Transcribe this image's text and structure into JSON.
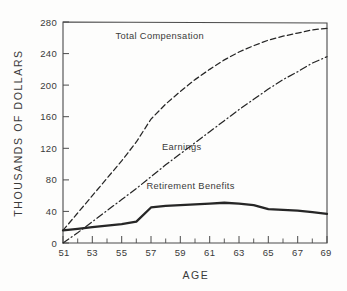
{
  "chart_data": {
    "type": "line",
    "title": "",
    "xlabel": "AGE",
    "ylabel": "THOUSANDS OF DOLLARS",
    "xlim": [
      51,
      69
    ],
    "ylim": [
      0,
      280
    ],
    "grid": false,
    "legend_position": "inline-annotations",
    "x": [
      51,
      52,
      53,
      54,
      55,
      56,
      57,
      58,
      59,
      60,
      61,
      62,
      63,
      64,
      65,
      66,
      67,
      68,
      69
    ],
    "xticks": [
      51,
      53,
      55,
      57,
      59,
      61,
      63,
      65,
      67,
      69
    ],
    "xtick_labels": [
      "51",
      "53",
      "55",
      "57",
      "59",
      "61",
      "63",
      "65",
      "67",
      "69"
    ],
    "xminor_ticks": [
      52,
      54,
      56,
      58,
      60,
      62,
      64,
      66,
      68
    ],
    "yticks": [
      0,
      40,
      80,
      120,
      160,
      200,
      240,
      280
    ],
    "ytick_labels": [
      "0",
      "40",
      "80",
      "120",
      "160",
      "200",
      "240",
      "280"
    ],
    "series": [
      {
        "name": "Total Compensation",
        "style": "dashed",
        "color": "#262626",
        "values": [
          16,
          38,
          60,
          82,
          104,
          128,
          157,
          176,
          192,
          207,
          220,
          232,
          242,
          250,
          257,
          262,
          266,
          270,
          272
        ]
      },
      {
        "name": "Earnings",
        "style": "dash-dot",
        "color": "#262626",
        "values": [
          0,
          13,
          27,
          41,
          55,
          69,
          84,
          99,
          113,
          127,
          141,
          155,
          169,
          182,
          195,
          207,
          217,
          228,
          236
        ]
      },
      {
        "name": "Retirement Benefits",
        "style": "solid",
        "color": "#262626",
        "values": [
          16,
          18,
          20,
          22,
          24,
          27,
          45,
          47,
          48,
          49,
          50,
          51,
          50,
          48,
          43,
          42,
          41,
          39,
          37
        ]
      }
    ],
    "annotations": [
      {
        "text": "Total Compensation",
        "x": 57.6,
        "y": 258
      },
      {
        "text": "Earnings",
        "x": 59.1,
        "y": 118
      },
      {
        "text": "Retirement Benefits",
        "x": 59.7,
        "y": 68
      }
    ]
  }
}
